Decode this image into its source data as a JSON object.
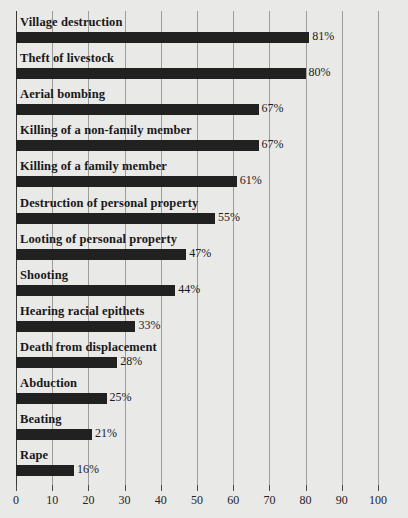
{
  "chart_data": {
    "type": "bar",
    "orientation": "horizontal",
    "title": "",
    "xlabel": "",
    "ylabel": "",
    "xlim": [
      0,
      100
    ],
    "xticks": [
      "0",
      "10",
      "20",
      "30",
      "40",
      "50",
      "60",
      "70",
      "80",
      "90",
      "100"
    ],
    "xtick_values": [
      0,
      10,
      20,
      30,
      40,
      50,
      60,
      70,
      80,
      90,
      100
    ],
    "grid": true,
    "legend": "none",
    "value_suffix": "%",
    "bar_color": "#212121",
    "background_color": "#e9e9e7",
    "gridline_color": "#9c9c9a",
    "axis_color": "#3a3a38",
    "categories": [
      "Village destruction",
      "Theft of livestock",
      "Aerial bombing",
      "Killing of a non-family member",
      "Killing of a family member",
      "Destruction of personal property",
      "Looting of personal property",
      "Shooting",
      "Hearing racial epithets",
      "Death from displacement",
      "Abduction",
      "Beating",
      "Rape"
    ],
    "values": [
      81,
      80,
      67,
      67,
      61,
      55,
      47,
      44,
      33,
      28,
      25,
      21,
      16
    ],
    "value_labels": [
      "81%",
      "80%",
      "67%",
      "67%",
      "61%",
      "55%",
      "47%",
      "44%",
      "33%",
      "28%",
      "25%",
      "21%",
      "16%"
    ],
    "rows": [
      {
        "label": "Village destruction",
        "value": 81,
        "value_label": "81%"
      },
      {
        "label": "Theft of livestock",
        "value": 80,
        "value_label": "80%"
      },
      {
        "label": "Aerial bombing",
        "value": 67,
        "value_label": "67%"
      },
      {
        "label": "Killing of a non-family member",
        "value": 67,
        "value_label": "67%"
      },
      {
        "label": "Killing of a family member",
        "value": 61,
        "value_label": "61%"
      },
      {
        "label": "Destruction of personal property",
        "value": 55,
        "value_label": "55%"
      },
      {
        "label": "Looting of personal property",
        "value": 47,
        "value_label": "47%"
      },
      {
        "label": "Shooting",
        "value": 44,
        "value_label": "44%"
      },
      {
        "label": "Hearing racial epithets",
        "value": 33,
        "value_label": "33%"
      },
      {
        "label": "Death from displacement",
        "value": 28,
        "value_label": "28%"
      },
      {
        "label": "Abduction",
        "value": 25,
        "value_label": "25%"
      },
      {
        "label": "Beating",
        "value": 21,
        "value_label": "21%"
      },
      {
        "label": "Rape",
        "value": 16,
        "value_label": "16%"
      }
    ]
  }
}
